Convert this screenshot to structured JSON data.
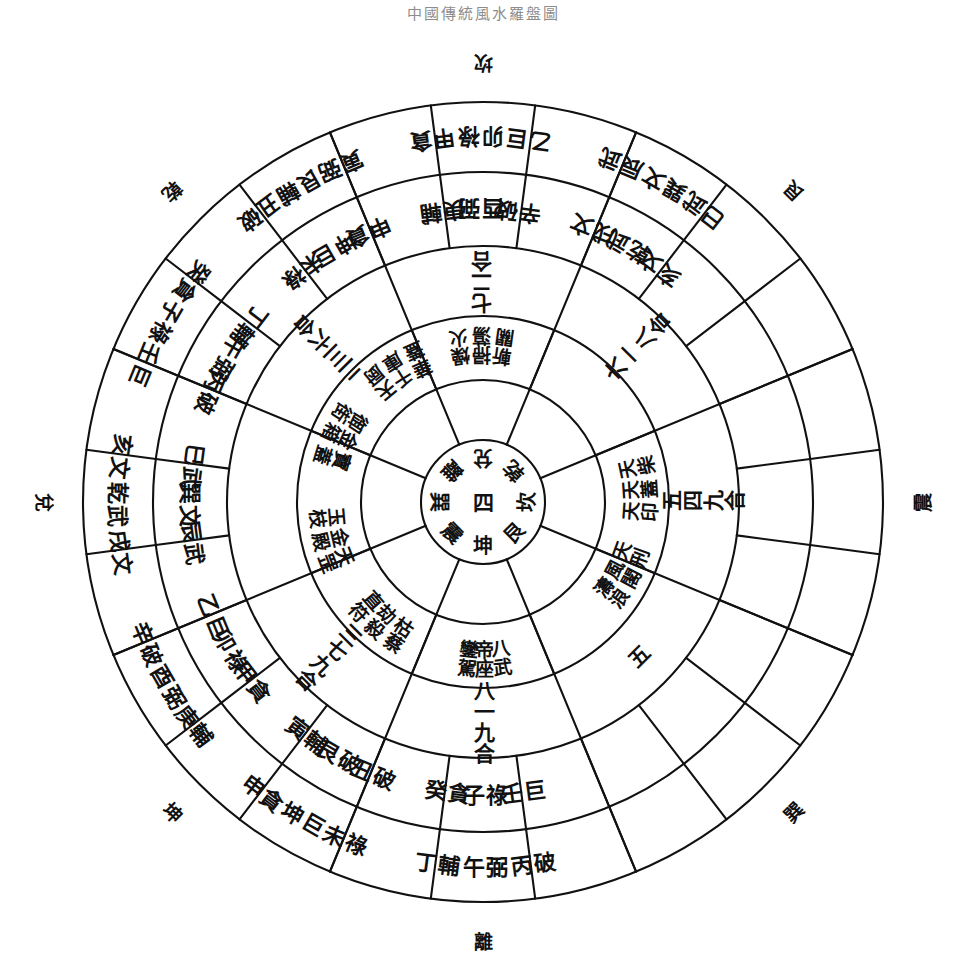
{
  "meta": {
    "title_faint": "中國傳統風水羅盤圖"
  },
  "outer_trigrams": [
    {
      "label": "離",
      "angle": 0,
      "name": "trigram-li"
    },
    {
      "label": "坤",
      "angle": 45,
      "name": "trigram-kun"
    },
    {
      "label": "兌",
      "angle": 90,
      "name": "trigram-dui"
    },
    {
      "label": "乾",
      "angle": 135,
      "name": "trigram-qian"
    },
    {
      "label": "坎",
      "angle": 180,
      "name": "trigram-kan"
    },
    {
      "label": "艮",
      "angle": 225,
      "name": "trigram-gen"
    },
    {
      "label": "震",
      "angle": 270,
      "name": "trigram-zhen"
    },
    {
      "label": "巽",
      "angle": 315,
      "name": "trigram-xun"
    }
  ],
  "ring_outer_24": [
    {
      "stem": "丙",
      "star": "破",
      "angle": 172.5
    },
    {
      "stem": "午",
      "star": "弼",
      "angle": 180
    },
    {
      "stem": "丁",
      "star": "輔",
      "angle": 187.5
    },
    {
      "stem": "未",
      "star": "祿",
      "angle": 202.5
    },
    {
      "stem": "坤",
      "star": "巨",
      "angle": 210
    },
    {
      "stem": "申",
      "star": "貪",
      "angle": 217.5
    },
    {
      "stem": "庚",
      "star": "輔",
      "angle": 232.5
    },
    {
      "stem": "酉",
      "star": "弼",
      "angle": 240
    },
    {
      "stem": "辛",
      "star": "破",
      "angle": 247.5
    },
    {
      "stem": "戌",
      "star": "文",
      "angle": 262.5
    },
    {
      "stem": "乾",
      "star": "武",
      "angle": 270
    },
    {
      "stem": "亥",
      "star": "文",
      "angle": 277.5
    },
    {
      "stem": "壬",
      "star": "巨",
      "angle": 292.5
    },
    {
      "stem": "子",
      "star": "祿",
      "angle": 300
    },
    {
      "stem": "癸",
      "star": "貪",
      "angle": 307.5
    },
    {
      "stem": "丑",
      "star": "破",
      "angle": 322.5
    },
    {
      "stem": "艮",
      "star": "輔",
      "angle": 330
    },
    {
      "stem": "寅",
      "star": "弼",
      "angle": 337.5
    },
    {
      "stem": "甲",
      "star": "貪",
      "angle": 352.5
    },
    {
      "stem": "卯",
      "star": "祿",
      "angle": 0
    },
    {
      "stem": "乙",
      "star": "巨",
      "angle": 7.5
    },
    {
      "stem": "辰",
      "star": "武",
      "angle": 22.5
    },
    {
      "stem": "巽",
      "star": "文",
      "angle": 30
    },
    {
      "stem": "巳",
      "star": "武",
      "angle": 37.5
    }
  ],
  "ring_second_24": [
    {
      "stem": "壬",
      "star": "巨",
      "angle": 172.5
    },
    {
      "stem": "子",
      "star": "祿",
      "angle": 180
    },
    {
      "stem": "癸",
      "star": "貪",
      "angle": 187.5
    },
    {
      "stem": "丑",
      "star": "破",
      "angle": 202.5
    },
    {
      "stem": "艮",
      "star": "破",
      "angle": 210
    },
    {
      "stem": "寅",
      "star": "輔",
      "angle": 217.5
    },
    {
      "stem": "甲",
      "star": "貪",
      "angle": 232.5
    },
    {
      "stem": "卯",
      "star": "祿",
      "angle": 240
    },
    {
      "stem": "乙",
      "star": "巨",
      "angle": 247.5
    },
    {
      "stem": "辰",
      "star": "武",
      "angle": 262.5
    },
    {
      "stem": "巽",
      "star": "文",
      "angle": 270
    },
    {
      "stem": "巳",
      "star": "武",
      "angle": 277.5
    },
    {
      "stem": "丙",
      "star": "破",
      "angle": 292.5
    },
    {
      "stem": "午",
      "star": "弼",
      "angle": 300
    },
    {
      "stem": "丁",
      "star": "輔",
      "angle": 307.5
    },
    {
      "stem": "未",
      "star": "祿",
      "angle": 322.5
    },
    {
      "stem": "坤",
      "star": "巨",
      "angle": 330
    },
    {
      "stem": "申",
      "star": "貪",
      "angle": 337.5
    },
    {
      "stem": "庚",
      "star": "輔",
      "angle": 352.5
    },
    {
      "stem": "酉",
      "star": "弼",
      "angle": 0
    },
    {
      "stem": "辛",
      "star": "破",
      "angle": 7.5
    },
    {
      "stem": "戌",
      "star": "文",
      "angle": 22.5
    },
    {
      "stem": "乾",
      "star": "武",
      "angle": 30
    },
    {
      "stem": "亥",
      "star": "文",
      "angle": 37.5
    }
  ],
  "ring_numbers": [
    {
      "label": "八一九合",
      "angle": 180
    },
    {
      "label": "三七九合",
      "angle": 225
    },
    {
      "label": "二三六合",
      "angle": 315
    },
    {
      "label": "七二合",
      "angle": 0
    },
    {
      "label": "六一八合",
      "angle": 45
    },
    {
      "label": "五四九合",
      "angle": 90
    },
    {
      "label": "五",
      "angle": 135
    }
  ],
  "ring_stars": [
    {
      "label": "鑾駕",
      "angle": 186
    },
    {
      "label": "帝座",
      "angle": 180
    },
    {
      "label": "八武",
      "angle": 174
    },
    {
      "label": "枯蔡",
      "angle": 213
    },
    {
      "label": "劫殺",
      "angle": 221
    },
    {
      "label": "直符",
      "angle": 229
    },
    {
      "label": "天罡",
      "angle": 249
    },
    {
      "label": "金殿",
      "angle": 257
    },
    {
      "label": "玉枝",
      "angle": 265
    },
    {
      "label": "寶蓋",
      "angle": 287
    },
    {
      "label": "金箱",
      "angle": 295
    },
    {
      "label": "御街",
      "angle": 303
    },
    {
      "label": "天厨",
      "angle": 320
    },
    {
      "label": "千庫",
      "angle": 328
    },
    {
      "label": "華蓋",
      "angle": 336
    },
    {
      "label": "燥火",
      "angle": 352
    },
    {
      "label": "掃蕩",
      "angle": 0
    },
    {
      "label": "斬關",
      "angle": 8
    },
    {
      "label": "天柴",
      "angle": 78
    },
    {
      "label": "天蓋",
      "angle": 86
    },
    {
      "label": "天印",
      "angle": 94
    },
    {
      "label": "天刑",
      "angle": 110
    },
    {
      "label": "風閣",
      "angle": 118
    },
    {
      "label": "濤浪",
      "angle": 126
    }
  ],
  "core": {
    "center": "四",
    "positions": [
      {
        "label": "坎",
        "angle": 90
      },
      {
        "label": "艮",
        "angle": 135
      },
      {
        "label": "坤",
        "angle": 180
      },
      {
        "label": "震",
        "angle": 225
      },
      {
        "label": "巽",
        "angle": 270
      },
      {
        "label": "離",
        "angle": 315
      },
      {
        "label": "兌",
        "angle": 0
      },
      {
        "label": "乾",
        "angle": 45
      }
    ]
  },
  "geometry": {
    "cx": 483,
    "cy": 502,
    "radii": [
      62,
      122,
      186,
      256,
      330,
      400
    ],
    "trigram_radius": 440
  }
}
